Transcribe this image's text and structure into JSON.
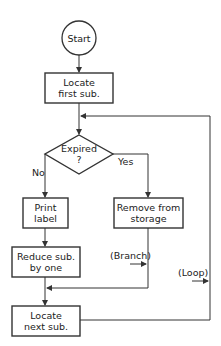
{
  "diagram": {
    "type": "flowchart",
    "nodes": {
      "start": {
        "shape": "circle",
        "text": "Start"
      },
      "locate_first": {
        "shape": "process",
        "line1": "Locate",
        "line2": "first sub."
      },
      "expired": {
        "shape": "decision",
        "line1": "Expired",
        "line2": "?"
      },
      "print_label": {
        "shape": "process",
        "line1": "Print",
        "line2": "label"
      },
      "remove": {
        "shape": "process",
        "line1": "Remove from",
        "line2": "storage"
      },
      "reduce": {
        "shape": "process",
        "line1": "Reduce sub.",
        "line2": "by one"
      },
      "locate_next": {
        "shape": "process",
        "line1": "Locate",
        "line2": "next sub."
      }
    },
    "edge_labels": {
      "no": "No",
      "yes": "Yes",
      "branch": "(Branch)",
      "loop": "(Loop)"
    },
    "edges": [
      {
        "from": "start",
        "to": "locate_first"
      },
      {
        "from": "locate_first",
        "to": "expired"
      },
      {
        "from": "expired",
        "to": "print_label",
        "label": "No"
      },
      {
        "from": "expired",
        "to": "remove",
        "label": "Yes"
      },
      {
        "from": "print_label",
        "to": "reduce"
      },
      {
        "from": "reduce",
        "to": "locate_next"
      },
      {
        "from": "remove",
        "to": "locate_next",
        "label": "(Branch)"
      },
      {
        "from": "locate_next",
        "to": "expired",
        "label": "(Loop)"
      }
    ],
    "line_color": "#333333"
  }
}
